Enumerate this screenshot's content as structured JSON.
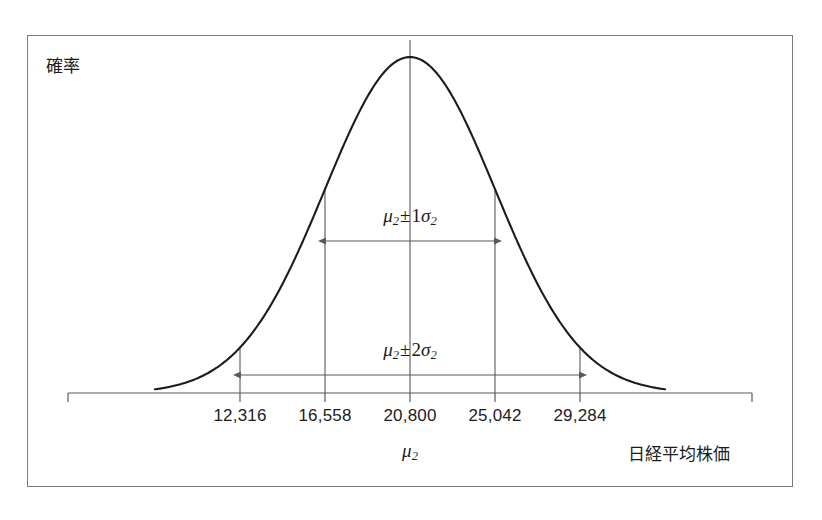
{
  "labels": {
    "y_axis_title": "確率",
    "x_axis_title": "日経平均株価",
    "center_mu": "μ",
    "center_mu_sub": "2",
    "sigma1_mu": "μ",
    "sigma1_mu_sub": "2",
    "sigma1_op": "±",
    "sigma1_num": "1",
    "sigma1_sigma": "σ",
    "sigma1_sigma_sub": "2",
    "sigma2_mu": "μ",
    "sigma2_mu_sub": "2",
    "sigma2_op": "±",
    "sigma2_num": "2",
    "sigma2_sigma": "σ",
    "sigma2_sigma_sub": "2"
  },
  "colors": {
    "curve": "#1c1c1c",
    "axis": "#595959",
    "frame": "#7a7a7a",
    "text": "#1c1c1c",
    "background": "#ffffff"
  },
  "chart_data": {
    "type": "line",
    "title": "",
    "subtitle": "",
    "xlabel": "日経平均株価",
    "ylabel": "確率",
    "distribution": "normal",
    "mean": 20800,
    "std": 4242,
    "grid": false,
    "legend": null,
    "xlim": [
      6500,
      35100
    ],
    "ylim": [
      0,
      1
    ],
    "categories": [
      "12,316",
      "16,558",
      "20,800",
      "25,042",
      "29,284"
    ],
    "x": [
      12316,
      16558,
      20800,
      25042,
      29284
    ],
    "values": [
      0.135,
      0.607,
      1.0,
      0.607,
      0.135
    ],
    "tick_labels": [
      "12,316",
      "16,558",
      "20,800",
      "25,042",
      "29,284"
    ],
    "tick_x_px": [
      240,
      325,
      410,
      495,
      580
    ],
    "sigma_multipliers": [
      -2,
      -1,
      0,
      1,
      2
    ],
    "annotations": [
      {
        "name": "sigma-1-span",
        "text": "μ2±1σ2",
        "from_value": 16558,
        "to_value": 25042,
        "from_px": 325,
        "to_px": 495,
        "y_px": 241
      },
      {
        "name": "sigma-2-span",
        "text": "μ2±2σ2",
        "from_value": 12316,
        "to_value": 29284,
        "from_px": 240,
        "to_px": 580,
        "y_px": 375
      }
    ],
    "axis_baseline_px": 393,
    "peak_px": {
      "x": 410,
      "y": 57
    }
  }
}
